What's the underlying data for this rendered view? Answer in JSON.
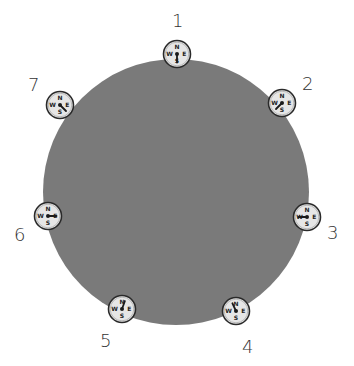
{
  "diagram": {
    "title": "",
    "planet": {
      "cx": 176,
      "cy": 192,
      "r": 133,
      "color": "#7a7a7a"
    },
    "compass_style": {
      "face": "#e6e6e6",
      "rim": "#2a2a2a",
      "needle": "#1a1a1a",
      "letters": [
        "N",
        "E",
        "S",
        "W"
      ]
    },
    "compasses": [
      {
        "id": "1",
        "label": "1",
        "cx": 177,
        "cy": 54,
        "needle_angle": 180,
        "label_x": 172,
        "label_y": 12
      },
      {
        "id": "2",
        "label": "2",
        "cx": 282,
        "cy": 103,
        "needle_angle": 225,
        "label_x": 302,
        "label_y": 75
      },
      {
        "id": "3",
        "label": "3",
        "cx": 307,
        "cy": 217,
        "needle_angle": 270,
        "label_x": 327,
        "label_y": 224
      },
      {
        "id": "4",
        "label": "4",
        "cx": 236,
        "cy": 311,
        "needle_angle": 335,
        "label_x": 242,
        "label_y": 338
      },
      {
        "id": "5",
        "label": "5",
        "cx": 122,
        "cy": 309,
        "needle_angle": 20,
        "label_x": 100,
        "label_y": 332
      },
      {
        "id": "6",
        "label": "6",
        "cx": 48,
        "cy": 216,
        "needle_angle": 90,
        "label_x": 14,
        "label_y": 226
      },
      {
        "id": "7",
        "label": "7",
        "cx": 60,
        "cy": 105,
        "needle_angle": 135,
        "label_x": 28,
        "label_y": 76
      }
    ]
  }
}
